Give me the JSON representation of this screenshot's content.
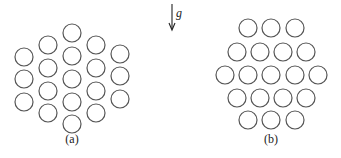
{
  "figure": {
    "gravity_label": "g",
    "panels": [
      {
        "label": "(a)",
        "arrangement": "hexagonal, columns vertical",
        "circles": [
          [
            24,
            57
          ],
          [
            24,
            79
          ],
          [
            24,
            102
          ],
          [
            48,
            45
          ],
          [
            48,
            68
          ],
          [
            48,
            91
          ],
          [
            48,
            113
          ],
          [
            72,
            33
          ],
          [
            72,
            56
          ],
          [
            72,
            79
          ],
          [
            72,
            102
          ],
          [
            72,
            124
          ],
          [
            96,
            45
          ],
          [
            96,
            68
          ],
          [
            96,
            91
          ],
          [
            96,
            113
          ],
          [
            120,
            54
          ],
          [
            120,
            76
          ],
          [
            120,
            99
          ]
        ]
      },
      {
        "label": "(b)",
        "arrangement": "hexagonal, rows horizontal",
        "circles": [
          [
            248,
            28
          ],
          [
            271,
            28
          ],
          [
            295,
            28
          ],
          [
            237,
            52
          ],
          [
            260,
            52
          ],
          [
            283,
            52
          ],
          [
            306,
            52
          ],
          [
            225,
            75
          ],
          [
            248,
            75
          ],
          [
            271,
            75
          ],
          [
            295,
            75
          ],
          [
            318,
            75
          ],
          [
            237,
            98
          ],
          [
            260,
            98
          ],
          [
            283,
            98
          ],
          [
            306,
            98
          ],
          [
            248,
            120
          ],
          [
            271,
            120
          ],
          [
            295,
            120
          ]
        ]
      }
    ],
    "circle_radius": 9,
    "stroke_color": "#555555"
  }
}
